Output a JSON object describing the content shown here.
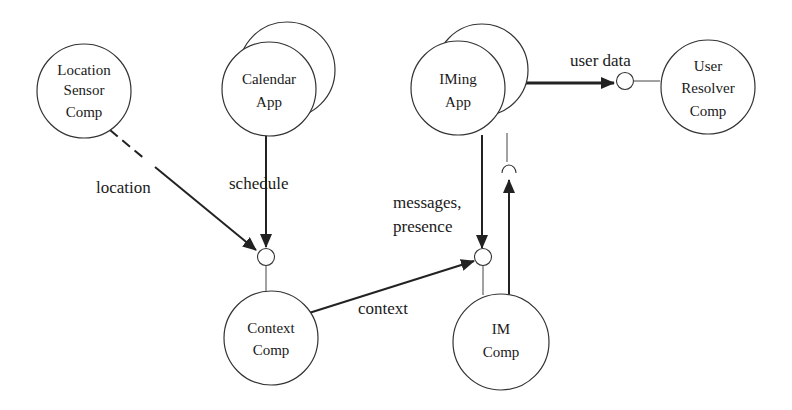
{
  "diagram": {
    "nodes": {
      "location_sensor": {
        "lines": [
          "Location",
          "Sensor",
          "Comp"
        ]
      },
      "calendar_app": {
        "lines": [
          "Calendar",
          "App"
        ]
      },
      "context_comp": {
        "lines": [
          "Context",
          "Comp"
        ]
      },
      "iming_app": {
        "lines": [
          "IMing",
          "App"
        ]
      },
      "user_resolver": {
        "lines": [
          "User",
          "Resolver",
          "Comp"
        ]
      },
      "im_comp": {
        "lines": [
          "IM",
          "Comp"
        ]
      }
    },
    "edges": {
      "location": "location",
      "schedule": "schedule",
      "context": "context",
      "messages_line1": "messages,",
      "messages_line2": "presence",
      "user_data": "user data"
    },
    "colors": {
      "stroke": "#333333",
      "text": "#1a1a1a",
      "background": "#ffffff"
    }
  }
}
